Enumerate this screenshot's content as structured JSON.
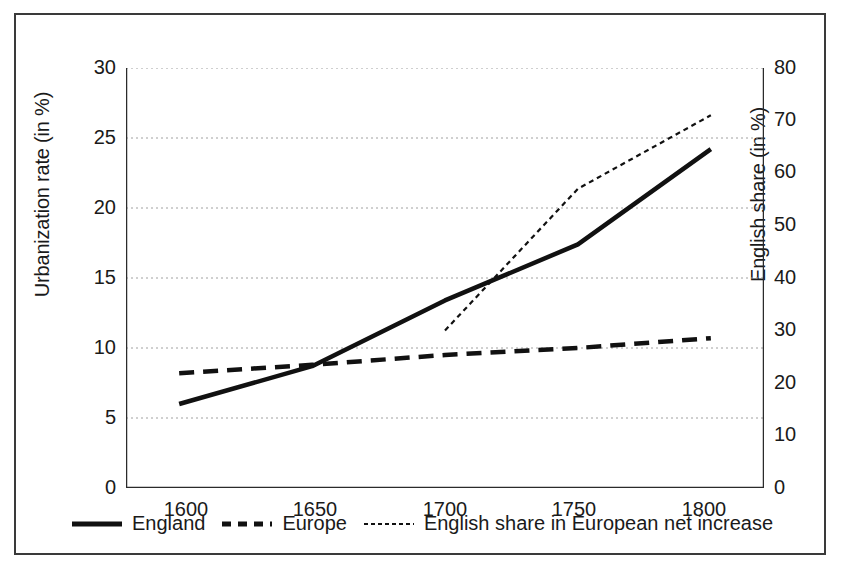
{
  "chart_data": {
    "type": "line",
    "title": "",
    "xlabel": "",
    "ylabel": "Urbanization rate (in %)",
    "y2label": "English share (in %)",
    "x": [
      1600,
      1650,
      1700,
      1750,
      1800
    ],
    "xlim": [
      1580,
      1820
    ],
    "ylim": [
      0,
      30
    ],
    "y2lim": [
      0,
      80
    ],
    "xticks": [
      "1600",
      "1650",
      "1700",
      "1750",
      "1800"
    ],
    "yticks": [
      "0",
      "5",
      "10",
      "15",
      "20",
      "25",
      "30"
    ],
    "y2ticks": [
      "0",
      "10",
      "20",
      "30",
      "40",
      "50",
      "60",
      "70",
      "80"
    ],
    "grid": true,
    "grid_style": "dotted-horizontal",
    "legend_position": "bottom",
    "series": [
      {
        "name": "England",
        "axis": "left",
        "style": "solid",
        "color": "#111111",
        "x": [
          1600,
          1650,
          1700,
          1750,
          1800
        ],
        "values": [
          6.0,
          8.7,
          13.4,
          17.4,
          24.2
        ]
      },
      {
        "name": "Europe",
        "axis": "left",
        "style": "dashed",
        "color": "#111111",
        "x": [
          1600,
          1650,
          1700,
          1750,
          1800
        ],
        "values": [
          8.2,
          8.8,
          9.5,
          10.0,
          10.7
        ]
      },
      {
        "name": "English share in European net increase",
        "axis": "right",
        "style": "dotted",
        "color": "#111111",
        "x": [
          1700,
          1750,
          1800
        ],
        "values": [
          30.0,
          57.0,
          71.0
        ]
      }
    ]
  },
  "axes": {
    "left": {
      "title": "Urbanization rate (in %)",
      "ticks": [
        "30",
        "25",
        "20",
        "15",
        "10",
        "5",
        "0"
      ]
    },
    "right": {
      "title": "English share (in %)",
      "ticks": [
        "80",
        "70",
        "60",
        "50",
        "40",
        "30",
        "20",
        "10",
        "0"
      ]
    },
    "bottom": {
      "ticks": [
        "1600",
        "1650",
        "1700",
        "1750",
        "1800"
      ]
    }
  },
  "legend": {
    "items": [
      {
        "label": "England",
        "style": "solid"
      },
      {
        "label": "Europe",
        "style": "dashed"
      },
      {
        "label": "English share in European net increase",
        "style": "dotted"
      }
    ]
  },
  "colors": {
    "ink": "#111111",
    "frame": "#3a3a3a",
    "grid": "#9a9a9a",
    "background": "#ffffff"
  }
}
